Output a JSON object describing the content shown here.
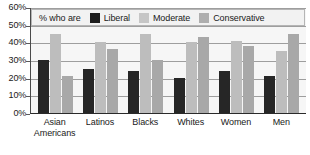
{
  "chart_data": {
    "type": "bar",
    "title": "",
    "xlabel": "",
    "ylabel": "",
    "ylim": [
      0,
      60
    ],
    "grid": true,
    "legend_position": "top-inside",
    "legend_prefix": "% who are",
    "y_ticks": [
      "0%",
      "10%",
      "20%",
      "30%",
      "40%",
      "50%",
      "60%"
    ],
    "y_tick_values": [
      0,
      10,
      20,
      30,
      40,
      50,
      60
    ],
    "categories": [
      "Asian Americans",
      "Latinos",
      "Blacks",
      "Whites",
      "Women",
      "Men"
    ],
    "category_lines": [
      [
        "Asian",
        "Americans"
      ],
      [
        "Latinos",
        ""
      ],
      [
        "Blacks",
        ""
      ],
      [
        "Whites",
        ""
      ],
      [
        "Women",
        ""
      ],
      [
        "Men",
        ""
      ]
    ],
    "series": [
      {
        "name": "Liberal",
        "color": "#262626",
        "values": [
          30,
          25,
          24,
          20,
          24,
          21
        ]
      },
      {
        "name": "Moderate",
        "color": "#bdbdbd",
        "values": [
          45,
          40,
          45,
          40,
          41,
          35
        ]
      },
      {
        "name": "Conservative",
        "color": "#a8a8a8",
        "values": [
          21,
          36,
          30,
          43,
          38,
          45
        ]
      }
    ]
  }
}
